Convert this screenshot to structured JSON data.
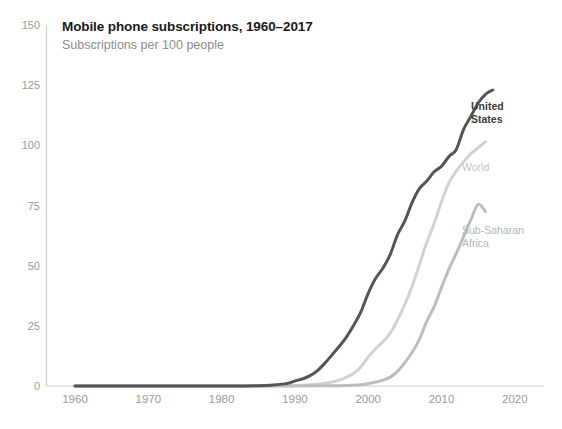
{
  "chart_data": {
    "type": "line",
    "title": "Mobile phone subscriptions, 1960–2017",
    "subtitle": "Subscriptions per 100 people",
    "xlabel": "",
    "ylabel": "",
    "xlim": [
      1958,
      2022
    ],
    "ylim": [
      0,
      150
    ],
    "xticks": [
      1960,
      1970,
      1980,
      1990,
      2000,
      2010,
      2020
    ],
    "yticks": [
      0,
      25,
      50,
      75,
      100,
      125,
      150
    ],
    "xtick_labels": [
      "1960",
      "1970",
      "1980",
      "1990",
      "2000",
      "2010",
      "2020"
    ],
    "ytick_labels": [
      "0",
      "25",
      "50",
      "75",
      "100",
      "125",
      "150"
    ],
    "grid": false,
    "legend_position": "inline-right",
    "series": [
      {
        "name": "United States",
        "color": "#555555",
        "label_lines": "United\nStates",
        "x": [
          1960,
          1965,
          1970,
          1975,
          1980,
          1983,
          1985,
          1987,
          1989,
          1990,
          1991,
          1992,
          1993,
          1994,
          1995,
          1996,
          1997,
          1998,
          1999,
          2000,
          2001,
          2002,
          2003,
          2004,
          2005,
          2006,
          2007,
          2008,
          2009,
          2010,
          2011,
          2012,
          2013,
          2014,
          2015,
          2016,
          2017
        ],
        "values": [
          0,
          0,
          0,
          0,
          0,
          0,
          0.1,
          0.4,
          1.1,
          2.1,
          2.9,
          4.2,
          6.2,
          9.2,
          12.7,
          16.3,
          20.2,
          25.1,
          30.8,
          38.5,
          44.7,
          48.9,
          54.6,
          62.9,
          68.6,
          76.3,
          82.1,
          85.2,
          89.0,
          91.3,
          95.3,
          98.2,
          106.5,
          112.0,
          117.6,
          121.2,
          123.0
        ]
      },
      {
        "name": "World",
        "color": "#d2d2d2",
        "label_lines": "World",
        "x": [
          1960,
          1965,
          1970,
          1975,
          1980,
          1985,
          1988,
          1990,
          1992,
          1994,
          1995,
          1996,
          1997,
          1998,
          1999,
          2000,
          2001,
          2002,
          2003,
          2004,
          2005,
          2006,
          2007,
          2008,
          2009,
          2010,
          2011,
          2012,
          2013,
          2014,
          2015,
          2016
        ],
        "values": [
          0,
          0,
          0,
          0,
          0,
          0,
          0.1,
          0.2,
          0.5,
          1.0,
          1.6,
          2.4,
          3.6,
          5.2,
          7.9,
          12.1,
          15.5,
          18.4,
          22.0,
          27.4,
          33.9,
          41.5,
          50.6,
          59.7,
          67.5,
          76.6,
          84.3,
          89.2,
          93.1,
          96.5,
          99.0,
          101.5
        ]
      },
      {
        "name": "Sub-Saharan Africa",
        "color": "#bdbdbd",
        "label_lines": "Sub-Saharan\nAfrica",
        "x": [
          1960,
          1970,
          1980,
          1985,
          1990,
          1993,
          1995,
          1997,
          1999,
          2000,
          2001,
          2002,
          2003,
          2004,
          2005,
          2006,
          2007,
          2008,
          2009,
          2010,
          2011,
          2012,
          2013,
          2014,
          2015,
          2016
        ],
        "values": [
          0,
          0,
          0,
          0,
          0,
          0.1,
          0.1,
          0.2,
          0.5,
          1.0,
          1.6,
          2.4,
          3.7,
          6.1,
          9.7,
          14.0,
          19.5,
          27.0,
          33.0,
          41.0,
          48.5,
          55.0,
          62.0,
          69.0,
          75.5,
          72.5
        ]
      }
    ]
  },
  "header": {
    "title": "Mobile phone subscriptions, 1960–2017",
    "subtitle": "Subscriptions per 100 people"
  },
  "axes": {
    "y_ticks": [
      "150",
      "125",
      "100",
      "75",
      "50",
      "25",
      "0"
    ],
    "x_ticks": [
      "1960",
      "1970",
      "1980",
      "1990",
      "2000",
      "2010",
      "2020"
    ]
  },
  "labels": {
    "united_states": "United\nStates",
    "world": "World",
    "sub_saharan_africa": "Sub-Saharan\nAfrica"
  },
  "colors": {
    "united_states": "#555555",
    "world": "#d2d2d2",
    "sub_saharan_africa": "#bdbdbd",
    "axis": "#cccccc",
    "tick_text": "#9a9a9a",
    "title": "#1a1a1a",
    "subtitle": "#8c8c8c"
  }
}
